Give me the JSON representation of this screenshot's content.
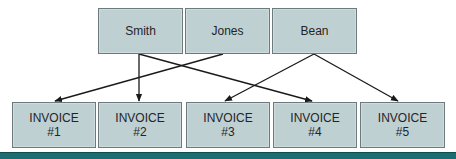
{
  "diagram": {
    "type": "one-to-many relationship diagram",
    "customers": [
      {
        "id": "smith",
        "label": "Smith"
      },
      {
        "id": "jones",
        "label": "Jones"
      },
      {
        "id": "bean",
        "label": "Bean"
      }
    ],
    "invoices": [
      {
        "id": "inv1",
        "line1": "INVOICE",
        "line2": "#1"
      },
      {
        "id": "inv2",
        "line1": "INVOICE",
        "line2": "#2"
      },
      {
        "id": "inv3",
        "line1": "INVOICE",
        "line2": "#3"
      },
      {
        "id": "inv4",
        "line1": "INVOICE",
        "line2": "#4"
      },
      {
        "id": "inv5",
        "line1": "INVOICE",
        "line2": "#5"
      }
    ],
    "links": [
      {
        "from": "Smith",
        "to": "INVOICE #2"
      },
      {
        "from": "Smith",
        "to": "INVOICE #4"
      },
      {
        "from": "Jones",
        "to": "INVOICE #1"
      },
      {
        "from": "Bean",
        "to": "INVOICE #3"
      },
      {
        "from": "Bean",
        "to": "INVOICE #5"
      }
    ],
    "colors": {
      "box_fill": "#bfd0d3",
      "box_border": "#6d7a7d",
      "line": "#1a1a1a",
      "bottom_bar": "#1a6e72"
    }
  }
}
